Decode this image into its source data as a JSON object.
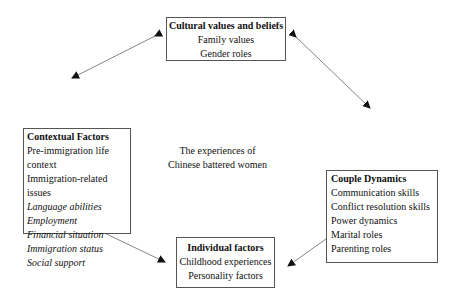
{
  "center": {
    "line1": "The experiences of",
    "line2": "Chinese battered women"
  },
  "cultural": {
    "title": "Cultural values and beliefs",
    "items": [
      "Family values",
      "Gender roles"
    ]
  },
  "contextual": {
    "title": "Contextual Factors",
    "items": [
      "Pre-immigration life context",
      "Immigration-related issues"
    ],
    "italic_items": [
      "Language abilities",
      "Employment",
      "Financial situation",
      "Immigration status",
      "Social support"
    ]
  },
  "couple": {
    "title": "Couple Dynamics",
    "items": [
      "Communication skills",
      "Conflict resolution skills",
      "Power dynamics",
      "Marital roles",
      "Parenting roles"
    ]
  },
  "individual": {
    "title": "Individual factors",
    "items": [
      "Childhood experiences",
      "Personality factors"
    ]
  },
  "arrows": [
    {
      "from": "cultural",
      "to": "contextual",
      "type": "bidirectional"
    },
    {
      "from": "cultural",
      "to": "couple",
      "type": "bidirectional"
    },
    {
      "from": "contextual",
      "to": "individual",
      "type": "bidirectional"
    },
    {
      "from": "couple",
      "to": "individual",
      "type": "bidirectional"
    }
  ],
  "colors": {
    "line": "#555555",
    "arrowhead": "#111111",
    "text": "#111111"
  }
}
